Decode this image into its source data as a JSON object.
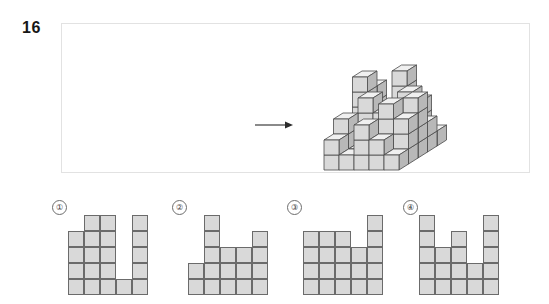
{
  "question": {
    "number": "16",
    "arrow_icon": "right-arrow-icon"
  },
  "stimulus": {
    "figure_type": "isometric-cube-stack",
    "cube_fill": "#d9d9d9",
    "cube_top_fill": "#f0f0f0",
    "cube_side_fill": "#b8b8b8",
    "cube_stroke": "#4a4a4a",
    "description": "3D isometric arrangement of unit cubes viewed from the front-left, with an arrow indicating the viewing direction"
  },
  "options": [
    {
      "label": "①",
      "name": "option-1",
      "cell_size": 16,
      "columns": 5,
      "rows": 5,
      "heights": [
        4,
        5,
        5,
        1,
        5
      ],
      "extra_cells": [
        [
          5,
          2
        ]
      ],
      "selected": false
    },
    {
      "label": "②",
      "name": "option-2",
      "cell_size": 16,
      "columns": 5,
      "rows": 5,
      "heights": [
        2,
        5,
        3,
        3,
        4
      ],
      "extra_cells": [],
      "selected": false
    },
    {
      "label": "③",
      "name": "option-3",
      "cell_size": 16,
      "columns": 5,
      "rows": 5,
      "heights": [
        4,
        4,
        4,
        3,
        5
      ],
      "extra_cells": [
        [
          5,
          2
        ]
      ],
      "selected": false
    },
    {
      "label": "④",
      "name": "option-4",
      "cell_size": 16,
      "columns": 5,
      "rows": 5,
      "heights": [
        5,
        3,
        4,
        2,
        5
      ],
      "extra_cells": [
        [
          5,
          2
        ]
      ],
      "selected": false
    }
  ],
  "style": {
    "cell_fill": "#d9d9d9",
    "cell_stroke": "#6b6b6b",
    "panel_border": "#e2e2e2",
    "text_color": "#171717"
  }
}
